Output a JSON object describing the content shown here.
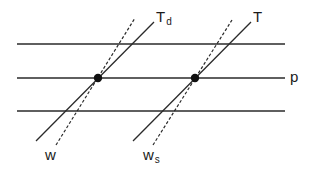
{
  "diagram": {
    "horizontal_lines": [
      {
        "y": 44
      },
      {
        "y": 78,
        "label": "p"
      },
      {
        "y": 111
      }
    ],
    "intersections": [
      {
        "point": [
          98,
          78
        ],
        "solid_line": {
          "label_top": "T",
          "label_top_sub": "d",
          "from": [
            36,
            141
          ],
          "to": [
            154,
            22
          ]
        },
        "dashed_line": {
          "label_bottom": "w",
          "label_bottom_sub": "",
          "from": [
            56,
            145
          ],
          "to": [
            135,
            18
          ]
        }
      },
      {
        "point": [
          195,
          78
        ],
        "solid_line": {
          "label_top": "T",
          "label_top_sub": "",
          "from": [
            133,
            141
          ],
          "to": [
            251,
            22
          ]
        },
        "dashed_line": {
          "label_bottom": "w",
          "label_bottom_sub": "s",
          "from": [
            153,
            145
          ],
          "to": [
            232,
            20
          ]
        }
      }
    ]
  },
  "labels": {
    "td_main": "T",
    "td_sub": "d",
    "t": "T",
    "p": "p",
    "w": "w",
    "ws_main": "w",
    "ws_sub": "s"
  },
  "colors": {
    "line": "#2a2a2a",
    "background": "#ffffff"
  }
}
